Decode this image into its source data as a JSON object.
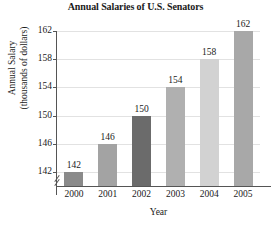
{
  "chart_data": {
    "type": "bar",
    "title": "Annual Salaries of U.S. Senators",
    "xlabel": "Year",
    "ylabel": "Annual Salary",
    "ylabel_line2": "(thousands of dollars)",
    "categories": [
      "2000",
      "2001",
      "2002",
      "2003",
      "2004",
      "2005"
    ],
    "values": [
      142,
      146,
      150,
      154,
      158,
      162
    ],
    "value_labels": [
      "142",
      "146",
      "150",
      "154",
      "158",
      "162"
    ],
    "bar_colors": [
      "#8a8a8a",
      "#a3a3a3",
      "#6b6b6b",
      "#b0b0b0",
      "#d2d2d2",
      "#a8a8a8"
    ],
    "yticks": [
      142,
      146,
      150,
      154,
      158,
      162
    ],
    "ytick_labels": [
      "142",
      "146",
      "150",
      "154",
      "158",
      "162"
    ],
    "ylim": [
      140,
      162
    ],
    "axis_break": true,
    "grid": true,
    "legend": "none",
    "gridline_color": "#e2e2e2",
    "axis_color": "#555555"
  }
}
